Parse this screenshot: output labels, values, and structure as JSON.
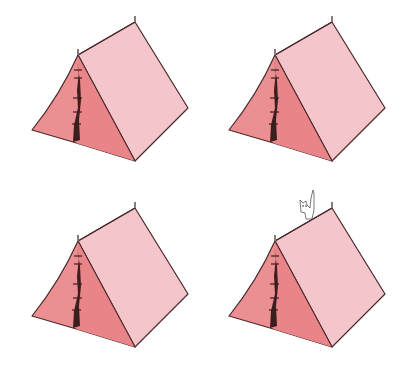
{
  "scene": {
    "description": "Four pink A-frame tents in a 2x2 grid; bottom-right tent has a small cat peeking over the ridge",
    "colors": {
      "background": "#ffffff",
      "roof": "#f4c6cb",
      "front": "#ec8f93",
      "front_shade": "#e57a80",
      "door": "#3a1f1f",
      "outline": "#4a2a2a",
      "cat": "#ffffff"
    },
    "tents": [
      {
        "id": "top-left",
        "has_cat": false
      },
      {
        "id": "top-right",
        "has_cat": false
      },
      {
        "id": "bottom-left",
        "has_cat": false
      },
      {
        "id": "bottom-right",
        "has_cat": true
      }
    ]
  }
}
